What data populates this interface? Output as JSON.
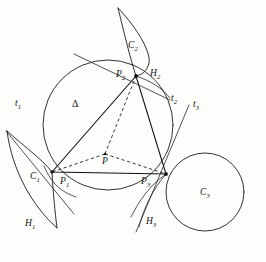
{
  "figure": {
    "kind": "geometric-diagram",
    "background_color": "#fdfdfc",
    "ink_color": "#1a1a1a"
  },
  "labels": {
    "triangle": {
      "text": "Δ",
      "x": 72,
      "y": 99
    },
    "center": {
      "text": "P",
      "x": 102,
      "y": 157
    },
    "vertices": [
      {
        "name": "vertex-label-p1",
        "text": "P",
        "sub": "1",
        "x": 60,
        "y": 177
      },
      {
        "name": "vertex-label-p2",
        "text": "P",
        "sub": "2",
        "x": 116,
        "y": 70
      },
      {
        "name": "vertex-label-p3",
        "text": "P",
        "sub": "3",
        "x": 141,
        "y": 177
      }
    ],
    "regions": [
      {
        "name": "region-label-c1",
        "text": "C",
        "sub": "1",
        "x": 30,
        "y": 172
      },
      {
        "name": "region-label-c2",
        "text": "C",
        "sub": "2",
        "x": 128,
        "y": 41
      },
      {
        "name": "region-label-c3",
        "text": "C",
        "sub": "3",
        "x": 200,
        "y": 188
      }
    ],
    "curves": [
      {
        "name": "curve-label-h1",
        "text": "H",
        "sub": "1",
        "x": 25,
        "y": 219
      },
      {
        "name": "curve-label-h2",
        "text": "H",
        "sub": "2",
        "x": 150,
        "y": 69
      },
      {
        "name": "curve-label-h3",
        "text": "H",
        "sub": "3",
        "x": 146,
        "y": 217
      }
    ],
    "tangents": [
      {
        "name": "tangent-label-t1",
        "text": "t",
        "sub": "1",
        "x": 15,
        "y": 99
      },
      {
        "name": "tangent-label-t2",
        "text": "t",
        "sub": "2",
        "x": 171,
        "y": 94
      },
      {
        "name": "tangent-label-t3",
        "text": "t",
        "sub": "3",
        "x": 193,
        "y": 100
      }
    ]
  },
  "geometry": {
    "circumcircle": {
      "cx": 108,
      "cy": 125,
      "r": 65
    },
    "incenter": {
      "x": 105,
      "y": 154
    },
    "vertex_points": {
      "p1": {
        "x": 52,
        "y": 172
      },
      "p2": {
        "x": 136,
        "y": 76
      },
      "p3": {
        "x": 166,
        "y": 174
      }
    },
    "circle_c3": {
      "cx": 205,
      "cy": 192,
      "r": 39
    },
    "triangle_path": "M 52 172 L 136 76 L 166 174 Z",
    "incenter_spokes": [
      "M 105 154 L 52 172",
      "M 105 154 L 136 76",
      "M 105 154 L 166 174"
    ],
    "tangent_lines": [
      {
        "name": "tangent-line-t1",
        "d": "M 6 131 L 74 214"
      },
      {
        "name": "tangent-line-t2",
        "d": "M 74 54 L 170 100"
      },
      {
        "name": "tangent-line-t3",
        "d": "M 189 105 L 136 232"
      }
    ],
    "region_c1_arcs": [
      "M 7 131 C 28 160 44 160 52 172",
      "M 7 131 C 14 172 36 209 59 228",
      "M 52 172 C 52 196 55 214 59 228"
    ],
    "region_c2_arcs": [
      "M 118 8 C 125 32 131 58 136 76",
      "M 118 8 C 138 30 150 52 149 62 C 148 70 142 75 136 76"
    ],
    "region_h3_arcs": [
      "M 166 174 C 154 188 144 206 139 226",
      "M 166 174 C 150 186 140 200 131 216"
    ],
    "region_h2_arc": "M 136 76 C 150 80 161 87 169 97",
    "tangent_circle_arc_left": "M 44 166 C 52 184 62 192 76 196"
  }
}
